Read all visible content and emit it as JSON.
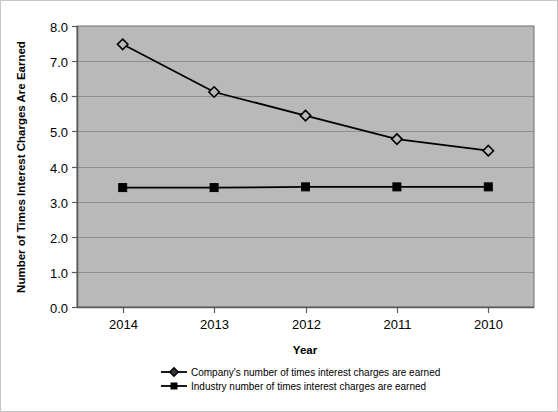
{
  "chart_data": {
    "type": "line",
    "title": "",
    "subtitle": "",
    "xlabel": "Year",
    "ylabel": "Number of Times Interest Charges Are Earned",
    "categories": [
      "2014",
      "2013",
      "2012",
      "2011",
      "2010"
    ],
    "series": [
      {
        "name": "Company's number of times interest charges are earned",
        "marker": "diamond",
        "color": "#000000",
        "values": [
          7.48,
          6.12,
          5.45,
          4.78,
          4.45
        ]
      },
      {
        "name": "Industry number of times interest charges are earned",
        "marker": "square",
        "color": "#000000",
        "values": [
          3.4,
          3.4,
          3.42,
          3.42,
          3.42
        ]
      }
    ],
    "ylim": [
      0.0,
      8.0
    ],
    "ytick_labels": [
      "0.0",
      "1.0",
      "2.0",
      "3.0",
      "4.0",
      "5.0",
      "6.0",
      "7.0",
      "8.0"
    ],
    "ytick_values": [
      0.0,
      1.0,
      2.0,
      3.0,
      4.0,
      5.0,
      6.0,
      7.0,
      8.0
    ],
    "grid": true,
    "grid_axis": "y",
    "legend_position": "bottom",
    "plot_background_color": "#b9b9b9",
    "grid_color": "#8f8f8f",
    "axis_color": "#5a5a5a",
    "figure_background_color": "#ffffff"
  },
  "yaxis": {
    "title": "Number of Times Interest Charges Are Earned",
    "ticks": [
      {
        "label": "8.0"
      },
      {
        "label": "7.0"
      },
      {
        "label": "6.0"
      },
      {
        "label": "5.0"
      },
      {
        "label": "4.0"
      },
      {
        "label": "3.0"
      },
      {
        "label": "2.0"
      },
      {
        "label": "1.0"
      },
      {
        "label": "0.0"
      }
    ]
  },
  "xaxis": {
    "title": "Year",
    "ticks": [
      {
        "label": "2014"
      },
      {
        "label": "2013"
      },
      {
        "label": "2012"
      },
      {
        "label": "2011"
      },
      {
        "label": "2010"
      }
    ]
  },
  "legend": {
    "items": [
      {
        "label": "Company's number of times interest charges are earned",
        "marker": "diamond-marker"
      },
      {
        "label": "Industry number of times interest charges are earned",
        "marker": "square-marker"
      }
    ]
  }
}
